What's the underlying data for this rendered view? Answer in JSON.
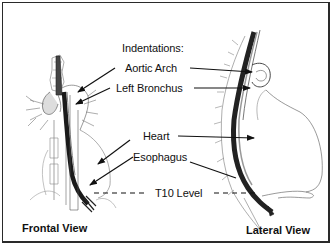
{
  "diagram": {
    "title_label": "Indentations:",
    "labels": {
      "aortic_arch": "Aortic Arch",
      "left_bronchus": "Left Bronchus",
      "heart": "Heart",
      "esophagus": "Esophagus",
      "t10_level": "T10 Level"
    },
    "views": {
      "frontal": "Frontal View",
      "lateral": "Lateral View"
    },
    "colors": {
      "line": "#111111",
      "border": "#2a2a2a",
      "background": "#ffffff",
      "shading": "#555555"
    }
  }
}
